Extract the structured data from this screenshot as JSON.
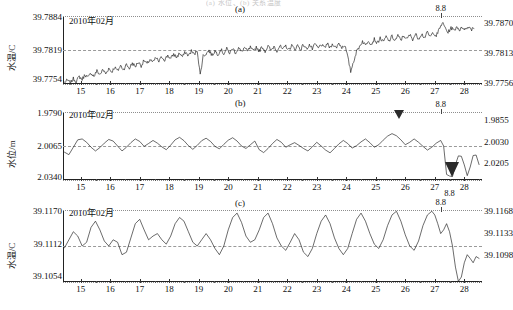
{
  "figure": {
    "title": "(a) 水位、(b) 关系温度",
    "month_label": "2010年02月",
    "panel_letters": [
      "(a)",
      "(b)",
      "(c)"
    ],
    "event_label": "8.8"
  },
  "chart_data": [
    {
      "type": "line",
      "panel": "(a)",
      "title": "2010年02月",
      "ylabel": "水温/C",
      "xlabel": "",
      "ylim": [
        39.7754,
        39.7884
      ],
      "yticks": [
        "39.7754",
        "39.7819",
        "39.7884"
      ],
      "xlim": [
        14.4,
        28.6
      ],
      "xticks": [
        "15",
        "16",
        "17",
        "18",
        "19",
        "20",
        "21",
        "22",
        "23",
        "24",
        "25",
        "26",
        "27",
        "28"
      ],
      "right_annotations": [
        "39.7870",
        "39.7813",
        "39.7756"
      ],
      "right_annotation_values": [
        39.787,
        39.7813,
        39.7756
      ],
      "event_marker": {
        "label": "8.8",
        "x": 27.2
      },
      "grid": true,
      "series": [
        {
          "name": "水温",
          "x": [
            14.45,
            14.55,
            14.65,
            14.75,
            14.85,
            14.95,
            15.05,
            15.15,
            15.25,
            15.35,
            15.45,
            15.55,
            15.65,
            15.75,
            15.85,
            15.95,
            16.05,
            16.15,
            16.25,
            16.35,
            16.45,
            16.55,
            16.65,
            16.75,
            16.85,
            16.95,
            17.05,
            17.15,
            17.25,
            17.35,
            17.45,
            17.55,
            17.65,
            17.75,
            17.85,
            17.95,
            18.05,
            18.15,
            18.25,
            18.35,
            18.45,
            18.55,
            18.65,
            18.75,
            18.85,
            18.95,
            19.05,
            19.15,
            19.25,
            19.35,
            19.45,
            19.55,
            19.65,
            19.75,
            19.85,
            19.95,
            20.05,
            20.15,
            20.25,
            20.35,
            20.45,
            20.55,
            20.65,
            20.75,
            20.85,
            20.95,
            21.05,
            21.15,
            21.25,
            21.35,
            21.45,
            21.55,
            21.65,
            21.75,
            21.85,
            21.95,
            22.05,
            22.15,
            22.25,
            22.35,
            22.45,
            22.55,
            22.65,
            22.75,
            22.85,
            22.95,
            23.05,
            23.15,
            23.25,
            23.35,
            23.45,
            23.55,
            23.65,
            23.75,
            23.85,
            23.95,
            24.05,
            24.15,
            24.25,
            24.35,
            24.45,
            24.55,
            24.65,
            24.75,
            24.85,
            24.95,
            25.05,
            25.15,
            25.25,
            25.35,
            25.45,
            25.55,
            25.65,
            25.75,
            25.85,
            25.95,
            26.05,
            26.15,
            26.25,
            26.35,
            26.45,
            26.55,
            26.65,
            26.75,
            26.85,
            26.95,
            27.05,
            27.15,
            27.25,
            27.35,
            27.45,
            27.55,
            27.65,
            27.75,
            27.85,
            27.95,
            28.05,
            28.15,
            28.25,
            28.35,
            28.45
          ],
          "y": [
            39.7757,
            39.7761,
            39.7756,
            39.7764,
            39.7759,
            39.7768,
            39.7763,
            39.7772,
            39.7766,
            39.7775,
            39.7769,
            39.7779,
            39.7772,
            39.7781,
            39.7774,
            39.7784,
            39.7777,
            39.7786,
            39.7779,
            39.7789,
            39.7782,
            39.7791,
            39.7784,
            39.7794,
            39.7787,
            39.7796,
            39.7789,
            39.7799,
            39.7792,
            39.7801,
            39.7795,
            39.7804,
            39.7797,
            39.7806,
            39.78,
            39.7809,
            39.7802,
            39.7811,
            39.7805,
            39.7813,
            39.7806,
            39.7815,
            39.7808,
            39.7817,
            39.781,
            39.7819,
            39.7771,
            39.7808,
            39.7812,
            39.7818,
            39.7809,
            39.7817,
            39.7811,
            39.782,
            39.7812,
            39.7821,
            39.7813,
            39.7822,
            39.7814,
            39.7823,
            39.7815,
            39.7824,
            39.7816,
            39.7824,
            39.7816,
            39.7825,
            39.7817,
            39.7825,
            39.7817,
            39.7826,
            39.7818,
            39.7826,
            39.7818,
            39.7827,
            39.7819,
            39.7827,
            39.7819,
            39.7828,
            39.782,
            39.7828,
            39.782,
            39.7829,
            39.7821,
            39.7829,
            39.7821,
            39.783,
            39.7822,
            39.783,
            39.7822,
            39.7831,
            39.7823,
            39.7831,
            39.7823,
            39.7832,
            39.7824,
            39.7829,
            39.7805,
            39.7778,
            39.7798,
            39.7816,
            39.7826,
            39.7836,
            39.7828,
            39.7838,
            39.783,
            39.784,
            39.7832,
            39.7842,
            39.7834,
            39.7844,
            39.7836,
            39.7845,
            39.7837,
            39.7846,
            39.7838,
            39.7847,
            39.7839,
            39.7848,
            39.784,
            39.7849,
            39.7841,
            39.785,
            39.7843,
            39.7852,
            39.7844,
            39.7853,
            39.7846,
            39.7858,
            39.7871,
            39.7862,
            39.7852,
            39.7862,
            39.7856,
            39.7864,
            39.7857,
            39.7863,
            39.7858,
            39.7864,
            39.7859,
            39.7864
          ]
        }
      ]
    },
    {
      "type": "line",
      "panel": "(b)",
      "title": "2010年02月",
      "ylabel": "水位/m",
      "xlabel": "",
      "ylim": [
        1.979,
        2.034
      ],
      "y_inverted": true,
      "yticks": [
        "1.9790",
        "2.0065",
        "2.0340"
      ],
      "xlim": [
        14.4,
        28.6
      ],
      "xticks": [
        "15",
        "16",
        "17",
        "18",
        "19",
        "20",
        "21",
        "22",
        "23",
        "24",
        "25",
        "26",
        "27",
        "28"
      ],
      "right_annotations": [
        "1.9855",
        "2.0030",
        "2.0205"
      ],
      "right_annotation_values": [
        1.9855,
        2.003,
        2.0205
      ],
      "event_markers": [
        {
          "label": "8.8",
          "x": 27.2,
          "position": "top"
        },
        {
          "label": "8.8",
          "x": 27.5,
          "position": "bottom"
        }
      ],
      "triangles": [
        {
          "x": 25.8,
          "direction": "down",
          "size": "small"
        },
        {
          "x": 27.6,
          "direction": "down",
          "size": "large"
        }
      ],
      "grid": true,
      "series": [
        {
          "name": "水位",
          "x": [
            14.45,
            14.6,
            14.75,
            14.9,
            15.05,
            15.2,
            15.35,
            15.5,
            15.65,
            15.8,
            15.95,
            16.1,
            16.25,
            16.4,
            16.55,
            16.7,
            16.85,
            17.0,
            17.15,
            17.3,
            17.45,
            17.6,
            17.75,
            17.9,
            18.05,
            18.2,
            18.35,
            18.5,
            18.65,
            18.8,
            18.95,
            19.1,
            19.25,
            19.4,
            19.55,
            19.7,
            19.85,
            20.0,
            20.15,
            20.3,
            20.45,
            20.6,
            20.75,
            20.9,
            21.05,
            21.2,
            21.35,
            21.5,
            21.65,
            21.8,
            21.95,
            22.1,
            22.25,
            22.4,
            22.55,
            22.7,
            22.85,
            23.0,
            23.15,
            23.3,
            23.45,
            23.6,
            23.75,
            23.9,
            24.05,
            24.2,
            24.35,
            24.5,
            24.65,
            24.8,
            24.95,
            25.1,
            25.25,
            25.4,
            25.55,
            25.7,
            25.85,
            26.0,
            26.15,
            26.3,
            26.45,
            26.6,
            26.75,
            26.9,
            27.05,
            27.2,
            27.3,
            27.4,
            27.5,
            27.6,
            27.7,
            27.8,
            27.9,
            28.0,
            28.1,
            28.2,
            28.3,
            28.4,
            28.5
          ],
          "y": [
            2.0115,
            2.0135,
            2.0075,
            2.0015,
            2.0008,
            2.0035,
            2.0075,
            2.0105,
            2.0078,
            2.0042,
            2.0012,
            2.0025,
            2.0065,
            2.0105,
            2.0075,
            2.0038,
            2.0008,
            2.0028,
            2.0068,
            2.0045,
            2.002,
            2.0042,
            2.0072,
            2.0095,
            2.0058,
            2.0015,
            1.9995,
            2.0022,
            2.0062,
            2.0092,
            2.006,
            2.0022,
            2.0002,
            2.0028,
            2.0068,
            2.0088,
            2.0052,
            2.0018,
            1.9998,
            2.0025,
            2.0065,
            2.0085,
            2.0055,
            2.0025,
            2.0095,
            2.0118,
            2.0085,
            2.0045,
            2.0012,
            2.0035,
            2.0075,
            2.0055,
            2.0038,
            2.006,
            2.0085,
            2.0105,
            2.0072,
            2.0035,
            2.0065,
            2.0098,
            2.012,
            2.0085,
            2.0048,
            2.002,
            2.0045,
            2.0082,
            2.0062,
            2.0032,
            2.0008,
            2.0038,
            2.0075,
            2.0055,
            2.0018,
            1.9985,
            1.9965,
            1.9982,
            2.0015,
            2.0055,
            2.0035,
            2.0008,
            2.0035,
            2.0068,
            2.0098,
            2.0075,
            2.0042,
            2.002,
            2.0065,
            2.0295,
            2.0308,
            2.0312,
            2.0215,
            2.0145,
            2.0148,
            2.0218,
            2.0305,
            2.0235,
            2.0142,
            2.0138,
            2.0215,
            2.0295
          ]
        }
      ]
    },
    {
      "type": "line",
      "panel": "(c)",
      "title": "2010年02月",
      "ylabel": "水温/C",
      "xlabel": "",
      "ylim": [
        39.1054,
        39.117
      ],
      "yticks": [
        "39.1054",
        "39.1112",
        "39.1170"
      ],
      "xlim": [
        14.4,
        28.6
      ],
      "xticks": [
        "15",
        "16",
        "17",
        "18",
        "19",
        "20",
        "21",
        "22",
        "23",
        "24",
        "25",
        "26",
        "27",
        "28"
      ],
      "right_annotations": [
        "39.1168",
        "39.1133",
        "39.1098"
      ],
      "right_annotation_values": [
        39.1168,
        39.1133,
        39.1098
      ],
      "event_marker": {
        "label": "8.8",
        "x": 27.2
      },
      "grid": true,
      "series": [
        {
          "name": "水温",
          "x": [
            14.45,
            14.6,
            14.75,
            14.9,
            15.05,
            15.2,
            15.35,
            15.5,
            15.65,
            15.8,
            15.95,
            16.1,
            16.25,
            16.4,
            16.55,
            16.7,
            16.85,
            17.0,
            17.15,
            17.3,
            17.45,
            17.6,
            17.75,
            17.9,
            18.05,
            18.2,
            18.35,
            18.5,
            18.65,
            18.8,
            18.95,
            19.1,
            19.25,
            19.4,
            19.55,
            19.7,
            19.85,
            20.0,
            20.15,
            20.3,
            20.45,
            20.6,
            20.75,
            20.9,
            21.05,
            21.2,
            21.35,
            21.5,
            21.65,
            21.8,
            21.95,
            22.1,
            22.25,
            22.4,
            22.55,
            22.7,
            22.85,
            23.0,
            23.15,
            23.3,
            23.45,
            23.6,
            23.75,
            23.9,
            24.05,
            24.2,
            24.35,
            24.5,
            24.65,
            24.8,
            24.95,
            25.1,
            25.25,
            25.4,
            25.55,
            25.7,
            25.85,
            26.0,
            26.15,
            26.3,
            26.45,
            26.6,
            26.75,
            26.9,
            27.0,
            27.1,
            27.2,
            27.3,
            27.4,
            27.5,
            27.6,
            27.7,
            27.8,
            27.9,
            28.0,
            28.1,
            28.2,
            28.3,
            28.4,
            28.5
          ],
          "y": [
            39.1109,
            39.1122,
            39.1135,
            39.1128,
            39.1112,
            39.1118,
            39.1142,
            39.1152,
            39.1138,
            39.112,
            39.1112,
            39.1122,
            39.1118,
            39.1098,
            39.1102,
            39.1125,
            39.1148,
            39.1155,
            39.1138,
            39.1122,
            39.1128,
            39.1132,
            39.1122,
            39.1115,
            39.1128,
            39.1148,
            39.1158,
            39.1152,
            39.1135,
            39.1118,
            39.1112,
            39.1122,
            39.1132,
            39.1122,
            39.1108,
            39.1098,
            39.1112,
            39.1138,
            39.1158,
            39.1165,
            39.115,
            39.1128,
            39.1118,
            39.1122,
            39.1138,
            39.1158,
            39.1165,
            39.1148,
            39.1125,
            39.1112,
            39.1105,
            39.1118,
            39.1132,
            39.1122,
            39.1102,
            39.1095,
            39.1108,
            39.1132,
            39.1152,
            39.1162,
            39.1148,
            39.1125,
            39.1108,
            39.1098,
            39.1108,
            39.1132,
            39.1155,
            39.1165,
            39.1152,
            39.1132,
            39.1115,
            39.1108,
            39.1122,
            39.1145,
            39.1162,
            39.1168,
            39.1152,
            39.113,
            39.1112,
            39.1105,
            39.112,
            39.1145,
            39.1162,
            39.1168,
            39.1162,
            39.1148,
            39.1132,
            39.1138,
            39.1148,
            39.1135,
            39.1112,
            39.1078,
            39.1055,
            39.1062,
            39.1085,
            39.1098,
            39.1092,
            39.1085,
            39.1095,
            39.1092
          ]
        }
      ]
    }
  ]
}
